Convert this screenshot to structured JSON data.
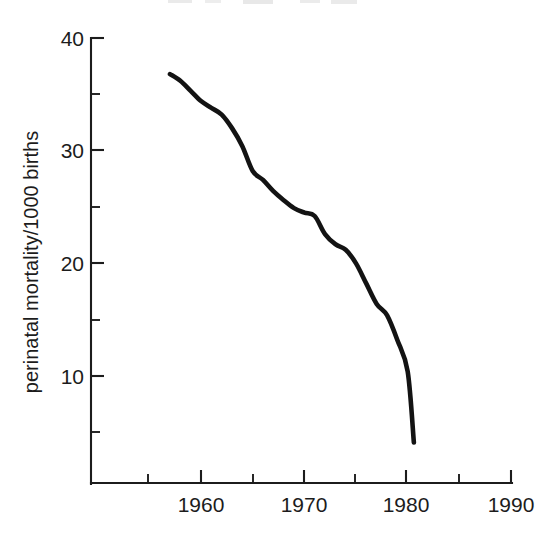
{
  "figure": {
    "background_color": "#ffffff",
    "ink_color": "#131313",
    "cropped_title_fragment": ""
  },
  "axes": {
    "y_axis": {
      "title": "perinatal mortality/1000 births",
      "major_ticks": [
        "10",
        "20",
        "30",
        "40"
      ],
      "minor_tick_values": [
        5,
        15,
        25,
        35
      ],
      "range_label_min": "",
      "range_label_max": ""
    },
    "x_axis": {
      "title": "",
      "major_ticks": [
        "1960",
        "1970",
        "1980",
        "1990"
      ],
      "minor_tick_values": [
        1955,
        1965,
        1975,
        1985
      ]
    }
  },
  "tick_labels": {
    "y0": "10",
    "y1": "20",
    "y2": "30",
    "y3": "40",
    "x0": "1960",
    "x1": "1970",
    "x2": "1980",
    "x3": "1990"
  },
  "chart_data": {
    "type": "line",
    "title": "",
    "xlabel": "",
    "ylabel": "perinatal mortality/1000 births",
    "xlim": [
      1952.2,
      1990
    ],
    "ylim": [
      0.0,
      41.0
    ],
    "grid": false,
    "legend": null,
    "xticks": [
      1960,
      1970,
      1980,
      1990
    ],
    "xticks_minor": [
      1955,
      1965,
      1975,
      1985
    ],
    "yticks": [
      10,
      20,
      30,
      40
    ],
    "yticks_minor": [
      5,
      15,
      25,
      35
    ],
    "series": [
      {
        "name": "perinatal mortality rate",
        "x": [
          1957.0,
          1958.0,
          1959.0,
          1960.0,
          1961.0,
          1962.0,
          1963.0,
          1964.0,
          1965.0,
          1966.0,
          1967.0,
          1968.0,
          1969.0,
          1970.0,
          1971.0,
          1972.0,
          1973.0,
          1974.0,
          1975.0,
          1976.0,
          1977.0,
          1978.0,
          1979.0,
          1980.0,
          1980.6
        ],
        "y": [
          36.8,
          36.2,
          35.3,
          34.4,
          33.8,
          33.2,
          32.0,
          30.4,
          28.2,
          27.4,
          26.4,
          25.6,
          24.9,
          24.5,
          24.2,
          22.6,
          21.7,
          21.2,
          20.0,
          18.2,
          16.4,
          15.4,
          13.2,
          10.4,
          4.1
        ]
      }
    ]
  }
}
